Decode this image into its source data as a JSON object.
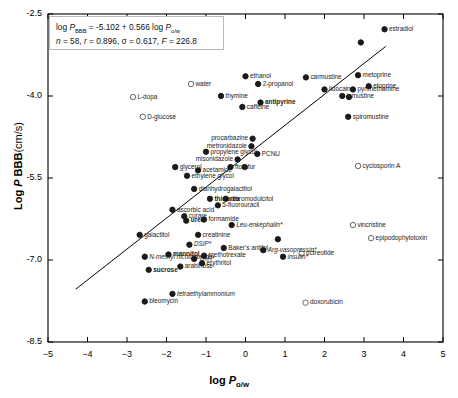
{
  "equation": {
    "line1_pre": "log ",
    "line1_P": "P",
    "line1_sub": "BBB",
    "line1_post": " = -5.102 + 0.566 log ",
    "line1_P2": "P",
    "line1_sub2": "o/w",
    "n_sym": "n",
    "n_val": " = 58, ",
    "r_sym": "r",
    "r_val": " = 0.896, ",
    "s_sym": "σ",
    "s_val": " = 0.617, ",
    "F_sym": "F",
    "F_val": " = 226.8"
  },
  "axes": {
    "x_title_pre": "log ",
    "x_title_P": "P",
    "x_title_sub": "o/w",
    "y_title_pre": "Log ",
    "y_title_P": "P",
    "y_title_post": " BBB",
    "y_title_unit": "(cm/s)",
    "xticks": [
      -5,
      -4,
      -3,
      -2,
      -1,
      0,
      1,
      2,
      3,
      4,
      5
    ],
    "xtick_labels": [
      "−5",
      "−4",
      "−3",
      "−2",
      "−1",
      "0",
      "1",
      "2",
      "3",
      "4",
      "5"
    ],
    "yticks": [
      -2.5,
      -4.0,
      -5.5,
      -7.0,
      -8.5
    ],
    "ytick_labels": [
      "-2.5",
      "-4.0",
      "-5.5",
      "-7.0",
      "-8.5"
    ],
    "xlim": [
      -5,
      5
    ],
    "ylim": [
      -8.5,
      -2.5
    ]
  },
  "chart_data": {
    "type": "scatter",
    "title": "",
    "xlabel": "log Po/w",
    "ylabel": "Log P BBB (cm/s)",
    "xlim": [
      -5,
      5
    ],
    "ylim": [
      -8.5,
      -2.5
    ],
    "grid": false,
    "legend": "none",
    "regression": {
      "slope": 0.566,
      "intercept": -5.102,
      "n": 58,
      "r": 0.896,
      "sigma": 0.617,
      "F": 226.8,
      "x_start": -4.3,
      "x_end": 3.55
    },
    "marker_styles": {
      "filled": "solid black circle",
      "open": "open circle (outlier / efflux substrate)"
    },
    "points": [
      {
        "name": "estradiol",
        "x": 3.52,
        "y": -2.78,
        "marker": "filled",
        "label_pos": "right",
        "style": "normal"
      },
      {
        "name": "metoprine",
        "x": 2.85,
        "y": -3.62,
        "marker": "filled",
        "label_pos": "right",
        "style": "normal"
      },
      {
        "name": "carmustine",
        "x": 1.53,
        "y": -3.66,
        "marker": "filled",
        "label_pos": "right",
        "style": "normal"
      },
      {
        "name": "ethanol",
        "x": 0.0,
        "y": -3.64,
        "marker": "filled",
        "label_pos": "right",
        "style": "normal"
      },
      {
        "name": "2-propanol",
        "x": 0.32,
        "y": -3.78,
        "marker": "filled",
        "label_pos": "right",
        "style": "normal"
      },
      {
        "name": "water",
        "x": -1.38,
        "y": -3.78,
        "marker": "open",
        "label_pos": "right",
        "style": "normal"
      },
      {
        "name": "etoprine",
        "x": 3.12,
        "y": -3.82,
        "marker": "filled",
        "label_pos": "right",
        "style": "normal"
      },
      {
        "name": "pyrimethamine",
        "x": 2.72,
        "y": -3.88,
        "marker": "filled",
        "label_pos": "right",
        "style": "normal"
      },
      {
        "name": "lidocaine",
        "x": 2.0,
        "y": -3.88,
        "marker": "filled",
        "label_pos": "right",
        "style": "normal"
      },
      {
        "name": "lomustine",
        "x": 2.45,
        "y": -4.0,
        "marker": "filled",
        "label_pos": "right",
        "style": "normal"
      },
      {
        "name": "thymine",
        "x": -0.62,
        "y": -4.0,
        "marker": "filled",
        "label_pos": "right",
        "style": "normal"
      },
      {
        "name": "L-dopa",
        "x": -2.85,
        "y": -4.02,
        "marker": "open",
        "label_pos": "right",
        "style": "normal"
      },
      {
        "name": "antipyrine",
        "x": 0.38,
        "y": -4.12,
        "marker": "filled",
        "label_pos": "right",
        "style": "bold"
      },
      {
        "name": "caffeine",
        "x": -0.08,
        "y": -4.2,
        "marker": "filled",
        "label_pos": "right",
        "style": "normal"
      },
      {
        "name": "spiromustine",
        "x": 2.6,
        "y": -4.38,
        "marker": "filled",
        "label_pos": "right",
        "style": "normal"
      },
      {
        "name": "D-glucose",
        "x": -2.6,
        "y": -4.38,
        "marker": "open",
        "label_pos": "right",
        "style": "normal"
      },
      {
        "name": "procarbazine",
        "x": 0.18,
        "y": -4.78,
        "marker": "filled",
        "label_pos": "left",
        "style": "normal"
      },
      {
        "name": "metronidazole",
        "x": 0.15,
        "y": -4.92,
        "marker": "filled",
        "label_pos": "left",
        "style": "normal"
      },
      {
        "name": "PCNU",
        "x": 0.3,
        "y": -5.06,
        "marker": "filled",
        "label_pos": "right",
        "style": "normal"
      },
      {
        "name": "propylene glycol",
        "x": -1.0,
        "y": -5.02,
        "marker": "filled",
        "label_pos": "right",
        "style": "normal"
      },
      {
        "name": "misonidazole",
        "x": -0.2,
        "y": -5.16,
        "marker": "filled",
        "label_pos": "left",
        "style": "normal"
      },
      {
        "name": "cyclosporin A",
        "x": 2.85,
        "y": -5.28,
        "marker": "open",
        "label_pos": "right",
        "style": "normal"
      },
      {
        "name": "ftorafur",
        "x": -0.38,
        "y": -5.3,
        "marker": "filled",
        "label_pos": "right",
        "style": "normal"
      },
      {
        "name": "glycerol",
        "x": -1.78,
        "y": -5.3,
        "marker": "filled",
        "label_pos": "right",
        "style": "normal"
      },
      {
        "name": "acetamide",
        "x": -1.2,
        "y": -5.36,
        "marker": "filled",
        "label_pos": "right",
        "style": "normal"
      },
      {
        "name": "ethylene glycol",
        "x": -1.48,
        "y": -5.46,
        "marker": "filled",
        "label_pos": "right",
        "style": "normal"
      },
      {
        "name": "dianhydrogalactitol",
        "x": -1.3,
        "y": -5.7,
        "marker": "filled",
        "label_pos": "right",
        "style": "normal"
      },
      {
        "name": "thiourea",
        "x": -0.9,
        "y": -5.88,
        "marker": "filled",
        "label_pos": "right",
        "style": "bold"
      },
      {
        "name": "dibromodulcitol",
        "x": -0.5,
        "y": -5.88,
        "marker": "filled",
        "label_pos": "right",
        "style": "normal"
      },
      {
        "name": "5-fluorouracil",
        "x": -0.7,
        "y": -6.0,
        "marker": "filled",
        "label_pos": "right",
        "style": "normal"
      },
      {
        "name": "ascorbic acid",
        "x": -1.85,
        "y": -6.08,
        "marker": "filled",
        "label_pos": "right",
        "style": "normal"
      },
      {
        "name": "curare",
        "x": -1.55,
        "y": -6.2,
        "marker": "filled",
        "label_pos": "right",
        "style": "normal"
      },
      {
        "name": "urea",
        "x": -1.5,
        "y": -6.28,
        "marker": "filled",
        "label_pos": "right",
        "style": "bold"
      },
      {
        "name": "formamide",
        "x": -1.05,
        "y": -6.26,
        "marker": "filled",
        "label_pos": "right",
        "style": "normal"
      },
      {
        "name": "Leu-enkephalin*",
        "x": -0.35,
        "y": -6.36,
        "marker": "filled",
        "label_pos": "right",
        "style": "italic"
      },
      {
        "name": "vincristine",
        "x": 2.72,
        "y": -6.36,
        "marker": "open",
        "label_pos": "right",
        "style": "normal"
      },
      {
        "name": "galactitol",
        "x": -2.68,
        "y": -6.54,
        "marker": "filled",
        "label_pos": "right",
        "style": "normal"
      },
      {
        "name": "creatinine",
        "x": -1.2,
        "y": -6.54,
        "marker": "filled",
        "label_pos": "right",
        "style": "normal"
      },
      {
        "name": "epipodophylotoxin",
        "x": 3.18,
        "y": -6.6,
        "marker": "open",
        "label_pos": "right",
        "style": "normal"
      },
      {
        "name": "DSIP*",
        "x": -1.42,
        "y": -6.72,
        "marker": "filled",
        "label_pos": "right",
        "style": "italic"
      },
      {
        "name": "Baker's antifol",
        "x": -0.55,
        "y": -6.78,
        "marker": "filled",
        "label_pos": "right",
        "style": "normal"
      },
      {
        "name": "Arg-vasopressin*",
        "x": 0.45,
        "y": -6.82,
        "marker": "filled",
        "label_pos": "right",
        "style": "italic"
      },
      {
        "name": "octreotide",
        "x": 1.42,
        "y": -6.88,
        "marker": "open",
        "label_pos": "right",
        "style": "normal"
      },
      {
        "name": "mannitol",
        "x": -1.95,
        "y": -6.9,
        "marker": "filled",
        "label_pos": "right",
        "style": "bold"
      },
      {
        "name": "methotrexate",
        "x": -1.05,
        "y": -6.92,
        "marker": "filled",
        "label_pos": "right",
        "style": "normal"
      },
      {
        "name": "insulin*",
        "x": 0.95,
        "y": -6.94,
        "marker": "filled",
        "label_pos": "right",
        "style": "italic"
      },
      {
        "name": "N-methyl nicotinamide",
        "x": -2.55,
        "y": -6.94,
        "marker": "filled",
        "label_pos": "right",
        "style": "italic"
      },
      {
        "name": "TRH*",
        "x": -1.3,
        "y": -6.98,
        "marker": "filled",
        "label_pos": "right",
        "style": "italic"
      },
      {
        "name": "erythritol",
        "x": -1.1,
        "y": -7.06,
        "marker": "filled",
        "label_pos": "right",
        "style": "normal"
      },
      {
        "name": "arabinose",
        "x": -1.65,
        "y": -7.12,
        "marker": "filled",
        "label_pos": "right",
        "style": "normal"
      },
      {
        "name": "sucrose",
        "x": -2.45,
        "y": -7.18,
        "marker": "filled",
        "label_pos": "right",
        "style": "bold"
      },
      {
        "name": "tetraethylammonium",
        "x": -1.85,
        "y": -7.62,
        "marker": "filled",
        "label_pos": "right",
        "style": "italic"
      },
      {
        "name": "bleomycin",
        "x": -2.55,
        "y": -7.76,
        "marker": "filled",
        "label_pos": "right",
        "style": "normal"
      },
      {
        "name": "doxorubicin",
        "x": 1.52,
        "y": -7.78,
        "marker": "open",
        "label_pos": "right",
        "style": "normal"
      },
      {
        "name": "unlabeled-1",
        "x": 2.92,
        "y": -3.02,
        "marker": "filled",
        "label_pos": "none",
        "style": "normal"
      },
      {
        "name": "unlabeled-2",
        "x": 2.62,
        "y": -4.02,
        "marker": "filled",
        "label_pos": "none",
        "style": "normal"
      },
      {
        "name": "unlabeled-3",
        "x": -0.02,
        "y": -5.3,
        "marker": "filled",
        "label_pos": "none",
        "style": "normal"
      },
      {
        "name": "unlabeled-4",
        "x": 0.82,
        "y": -6.62,
        "marker": "filled",
        "label_pos": "none",
        "style": "normal"
      }
    ]
  }
}
